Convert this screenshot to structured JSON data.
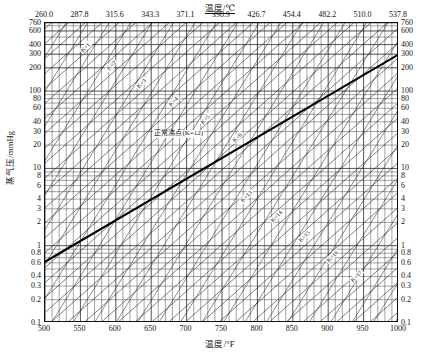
{
  "chart_data": {
    "type": "line",
    "title": "",
    "xlabel": "温度/°F",
    "ylabel": "蒸气压/mmHg",
    "xlabel_top": "温度/℃",
    "xlim": [
      500,
      1000
    ],
    "ylim": [
      0.1,
      760
    ],
    "yscale": "log",
    "xscale": "linear",
    "grid": true,
    "legend": "none",
    "x_ticks_bottom": [
      500,
      550,
      600,
      650,
      700,
      750,
      800,
      850,
      900,
      950,
      1000
    ],
    "x_ticks_top": [
      260.0,
      287.8,
      315.6,
      343.3,
      371.1,
      398.9,
      426.7,
      454.4,
      482.2,
      510.0,
      537.8
    ],
    "y_ticks": [
      760,
      600,
      400,
      300,
      200,
      100,
      80,
      60,
      40,
      30,
      20,
      10,
      8,
      6,
      4,
      3,
      2,
      1,
      0.8,
      0.6,
      0.4,
      0.3,
      0.2,
      0.1
    ],
    "y_ticks_labels": [
      "760",
      "600",
      "400",
      "300",
      "200",
      "100",
      "80",
      "60",
      "40",
      "30",
      "20",
      "10",
      "8",
      "6",
      "4",
      "3",
      "2",
      "1",
      "0.8",
      "0.6",
      "0.4",
      "0.3",
      "0.2",
      "0.1"
    ],
    "annotations": [
      {
        "text": "正常沸点(K=12)",
        "x": 735,
        "y": 26,
        "rotation": 0
      }
    ],
    "series": [
      {
        "name": "K=12 normal boiling point",
        "emphasis": true,
        "x": [
          500,
          1000
        ],
        "y": [
          0.62,
          300
        ]
      }
    ],
    "diagonal_labels_upper": [
      "K=1",
      "K=2",
      "K=3",
      "K=4",
      "K=5",
      "K=6"
    ],
    "diagonal_labels_lower": [
      "K=13",
      "K=14",
      "K=15",
      "K=16",
      "K=17"
    ],
    "line_family_a_count": 34,
    "line_family_b_count": 30
  },
  "axes": {
    "top_title": "温度/℃",
    "bottom_title": "温度/°F",
    "left_title": "蒸气压/mmHg"
  },
  "labels": {
    "boiling_point": "正常沸点(K=12)",
    "k_upper": [
      "K=1",
      "K=2",
      "K=3",
      "K=4",
      "K=5",
      "K=6"
    ],
    "k_lower": [
      "K=13",
      "K=14",
      "K=15",
      "K=16",
      "K=17"
    ]
  }
}
